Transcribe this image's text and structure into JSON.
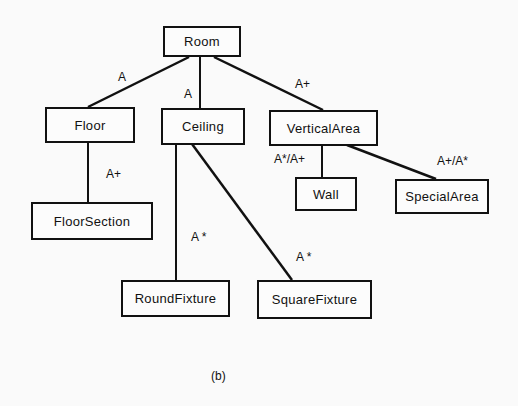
{
  "diagram": {
    "nodes": {
      "room": "Room",
      "floor": "Floor",
      "ceiling": "Ceiling",
      "vertical_area": "VerticalArea",
      "wall": "Wall",
      "special_area": "SpecialArea",
      "floor_section": "FloorSection",
      "round_fixture": "RoundFixture",
      "square_fixture": "SquareFixture"
    },
    "edges": [
      {
        "from": "Room",
        "to": "Floor",
        "label": "A"
      },
      {
        "from": "Room",
        "to": "Ceiling",
        "label": "A"
      },
      {
        "from": "Room",
        "to": "VerticalArea",
        "label": "A+"
      },
      {
        "from": "Floor",
        "to": "FloorSection",
        "label": "A+"
      },
      {
        "from": "Ceiling",
        "to": "RoundFixture",
        "label": "A *"
      },
      {
        "from": "Ceiling",
        "to": "SquareFixture",
        "label": "A *"
      },
      {
        "from": "VerticalArea",
        "to": "Wall",
        "label": "A*/A+"
      },
      {
        "from": "VerticalArea",
        "to": "SpecialArea",
        "label": "A+/A*"
      }
    ],
    "caption": "(b)"
  }
}
